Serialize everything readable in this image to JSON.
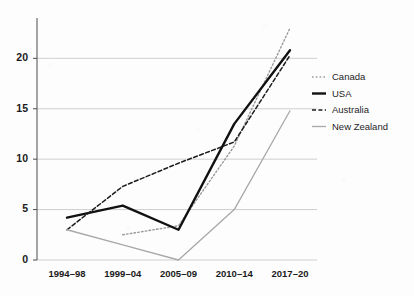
{
  "chart_data": {
    "type": "line",
    "title": "",
    "xlabel": "",
    "ylabel": "",
    "categories": [
      "1994–98",
      "1999–04",
      "2005–09",
      "2010–14",
      "2017–20"
    ],
    "ylim": [
      0,
      24
    ],
    "xlim": [
      0,
      4
    ],
    "yticks": [
      0,
      5,
      10,
      15,
      20
    ],
    "ytick_labels": [
      "0",
      "5",
      "10",
      "15",
      "20"
    ],
    "grid": true,
    "grid_axis": "y",
    "legend_position": "right",
    "series": [
      {
        "name": "Canada",
        "style": "dotted",
        "color": "#9a9a9a",
        "width": 1.4,
        "x": [
          "1999–04",
          "2005–09",
          "2010–14",
          "2017–20"
        ],
        "values": [
          2.5,
          3.4,
          11.3,
          23.0
        ]
      },
      {
        "name": "USA",
        "style": "solid",
        "color": "#111111",
        "width": 2.4,
        "x": [
          "1994–98",
          "1999–04",
          "2005–09",
          "2010–14",
          "2017–20"
        ],
        "values": [
          4.2,
          5.4,
          3.0,
          13.5,
          20.8
        ]
      },
      {
        "name": "Australia",
        "style": "dashed",
        "color": "#1d1d1d",
        "width": 1.5,
        "x": [
          "1994–98",
          "1999–04",
          "2005–09",
          "2010–14",
          "2017–20"
        ],
        "values": [
          3.0,
          7.3,
          9.6,
          11.7,
          20.3
        ]
      },
      {
        "name": "New Zealand",
        "style": "solid",
        "color": "#a8a8a8",
        "width": 1.3,
        "x": [
          "1994–98",
          "1999–04",
          "2005–09",
          "2010–14",
          "2017–20"
        ],
        "values": [
          3.0,
          1.5,
          0.0,
          5.0,
          14.8
        ]
      }
    ]
  },
  "legend": {
    "items": [
      {
        "label": "Canada"
      },
      {
        "label": "USA"
      },
      {
        "label": "Australia"
      },
      {
        "label": "New Zealand"
      }
    ]
  },
  "axes": {
    "y_tick_labels": [
      "20",
      "15",
      "10",
      "5",
      "0"
    ],
    "x_tick_labels": [
      "1994–98",
      "1999–04",
      "2005–09",
      "2010–14",
      "2017–20"
    ]
  },
  "colors": {
    "axis": "#4d4d4d",
    "grid": "#c9c9c9",
    "canada": "#9a9a9a",
    "usa": "#111111",
    "australia": "#1d1d1d",
    "new_zealand": "#a8a8a8",
    "background": "#fdfdfd"
  }
}
